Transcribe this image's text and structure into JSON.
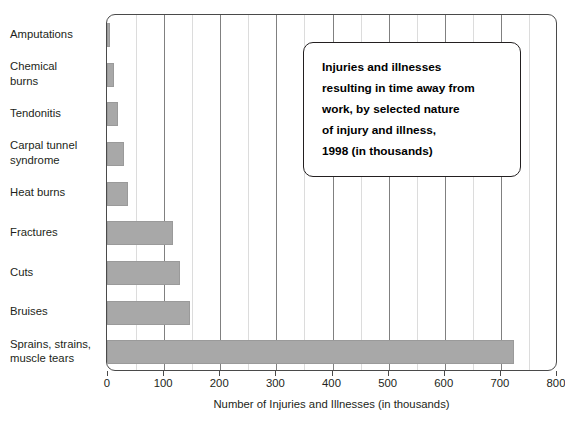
{
  "chart_data": {
    "type": "bar",
    "orientation": "horizontal",
    "title_lines": [
      "Injuries and illnesses",
      "resulting in time away from",
      "work, by selected nature",
      "of injury and illness,",
      "1998 (in thousands)"
    ],
    "xlabel": "Number of Injuries and Illnesses (in thousands)",
    "ylabel": "",
    "xlim": [
      0,
      800
    ],
    "xticks": [
      0,
      100,
      200,
      300,
      400,
      500,
      600,
      700,
      800
    ],
    "xtick_labels": [
      "0",
      "100",
      "200",
      "300",
      "400",
      "500",
      "600",
      "700",
      "800"
    ],
    "minor_gridlines": [
      50,
      150,
      250,
      350,
      450,
      550,
      650,
      750
    ],
    "grid": true,
    "legend": "none",
    "bar_color": "#a8a8a8",
    "categories": [
      "Amputations",
      "Chemical\nburns",
      "Tendonitis",
      "Carpal tunnel\nsyndrome",
      "Heat burns",
      "Fractures",
      "Cuts",
      "Bruises",
      "Sprains, strains,\nmuscle tears"
    ],
    "values": [
      6,
      12,
      20,
      30,
      38,
      117,
      130,
      148,
      725
    ]
  },
  "colors": {
    "bar_fill": "#a8a8a8",
    "bar_edge": "#9a9a9a",
    "axis": "#4a4a4a",
    "major_grid": "#808080",
    "minor_grid": "#dcdcdc",
    "text": "#231f20",
    "title_border": "#231f20",
    "background": "#ffffff"
  }
}
